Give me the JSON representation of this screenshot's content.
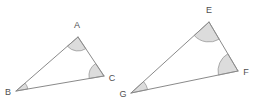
{
  "figure": {
    "background_color": "#ffffff",
    "line_color": "#8a8a8a",
    "angle_fill_color": "#dcdcdc",
    "angle_stroke_color": "#9a9a9a",
    "label_color": "#4f4f4f",
    "line_width": "1",
    "canvas": {
      "width": 256,
      "height": 106
    }
  },
  "triangles": [
    {
      "name": "triangle-abc",
      "label": "ABC",
      "vertices": [
        {
          "id": "A",
          "label": "A",
          "x": 78,
          "y": 37,
          "label_x": 77,
          "label_y": 26,
          "marked": true
        },
        {
          "id": "B",
          "label": "B",
          "x": 16,
          "y": 91,
          "label_x": 8,
          "label_y": 93,
          "marked": true
        },
        {
          "id": "C",
          "label": "C",
          "x": 104,
          "y": 76,
          "label_x": 112,
          "label_y": 79,
          "marked": true
        }
      ],
      "edges": [
        {
          "id": "AB",
          "from": "A",
          "to": "B"
        },
        {
          "id": "BC",
          "from": "B",
          "to": "C"
        },
        {
          "id": "CA",
          "from": "C",
          "to": "A"
        }
      ],
      "angle_marks": [
        {
          "at": "A",
          "radius": 14
        },
        {
          "at": "B",
          "radius": 12
        },
        {
          "at": "C",
          "radius": 15
        }
      ]
    },
    {
      "name": "triangle-efg",
      "label": "EFG",
      "vertices": [
        {
          "id": "E",
          "label": "E",
          "x": 209,
          "y": 22,
          "label_x": 209,
          "label_y": 11,
          "marked": true
        },
        {
          "id": "G",
          "label": "G",
          "x": 131,
          "y": 93,
          "label_x": 123,
          "label_y": 95,
          "marked": true
        },
        {
          "id": "F",
          "label": "F",
          "x": 238,
          "y": 71,
          "label_x": 246,
          "label_y": 73,
          "marked": true
        }
      ],
      "edges": [
        {
          "id": "EG",
          "from": "E",
          "to": "G"
        },
        {
          "id": "GF",
          "from": "G",
          "to": "F"
        },
        {
          "id": "FE",
          "from": "F",
          "to": "E"
        }
      ],
      "angle_marks": [
        {
          "at": "E",
          "radius": 20
        },
        {
          "at": "G",
          "radius": 17
        },
        {
          "at": "F",
          "radius": 20
        }
      ]
    }
  ]
}
